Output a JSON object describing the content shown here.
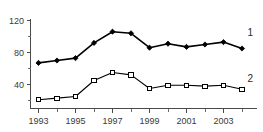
{
  "chart_data": {
    "type": "line",
    "title": "",
    "subtitle": "",
    "xlabel": "",
    "ylabel": "",
    "x": [
      1993,
      1994,
      1995,
      1996,
      1997,
      1998,
      1999,
      2000,
      2001,
      2002,
      2003,
      2004
    ],
    "categories": [
      "1993",
      "1994",
      "1995",
      "1996",
      "1997",
      "1998",
      "1999",
      "2000",
      "2001",
      "2002",
      "2003",
      "2004"
    ],
    "series": [
      {
        "name": "1",
        "label": "1",
        "marker": "filled-diamond",
        "color": "#000000",
        "values": [
          67,
          70,
          73,
          92,
          106,
          104,
          86,
          91,
          87,
          90,
          93,
          85
        ]
      },
      {
        "name": "2",
        "label": "2",
        "marker": "open-square",
        "color": "#000000",
        "values": [
          21,
          23,
          25,
          45,
          55,
          52,
          35,
          39,
          39,
          38,
          39,
          34
        ]
      }
    ],
    "ylim": [
      10,
      120
    ],
    "xlim": [
      1992.6,
      2004.6
    ],
    "yticks": [
      40,
      80,
      120
    ],
    "ytick_labels": [
      "40",
      "80",
      "120"
    ],
    "yticks_minor": [
      20,
      60,
      100
    ],
    "xticks": [
      1993,
      1995,
      1997,
      1999,
      2001,
      2003
    ],
    "xtick_labels": [
      "1993",
      "1995",
      "1997",
      "1999",
      "2001",
      "2003"
    ],
    "xticks_minor": [
      1994,
      1996,
      1998,
      2000,
      2002,
      2004
    ],
    "grid": false,
    "legend_position": "inline-right",
    "annotations": [
      {
        "text": "1",
        "series": "1",
        "x": 2004.45,
        "y": 104
      },
      {
        "text": "2",
        "series": "2",
        "x": 2004.45,
        "y": 47
      }
    ]
  },
  "axis": {
    "y_label_120": "120",
    "y_label_80": "80",
    "y_label_40": "40",
    "x_label_1993": "1993",
    "x_label_1995": "1995",
    "x_label_1997": "1997",
    "x_label_1999": "1999",
    "x_label_2001": "2001",
    "x_label_2003": "2003"
  },
  "legend": {
    "series_1_tag": "1",
    "series_2_tag": "2"
  },
  "colors": {
    "axis": "#4a4a4a",
    "text": "#3a3a3a",
    "series_1": "#000000",
    "series_2": "#000000",
    "background": "#ffffff"
  }
}
